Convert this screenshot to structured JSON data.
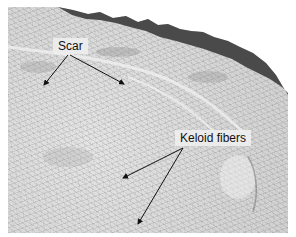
{
  "figure": {
    "background_color": "#ffffff",
    "tissue_color": "#d9d9d9",
    "epidermis_color": "#4a4a4a",
    "labels": [
      {
        "text": "Scar",
        "x": 53,
        "y": 38
      },
      {
        "text": "Keloid fibers",
        "x": 175,
        "y": 130
      }
    ],
    "arrows": [
      {
        "label": "Scar",
        "from": [
          68,
          55
        ],
        "to": [
          44,
          85
        ]
      },
      {
        "label": "Scar",
        "from": [
          70,
          55
        ],
        "to": [
          124,
          84
        ]
      },
      {
        "label": "Keloid fibers",
        "from": [
          183,
          148
        ],
        "to": [
          123,
          178
        ]
      },
      {
        "label": "Keloid fibers",
        "from": [
          183,
          148
        ],
        "to": [
          138,
          224
        ]
      }
    ]
  }
}
